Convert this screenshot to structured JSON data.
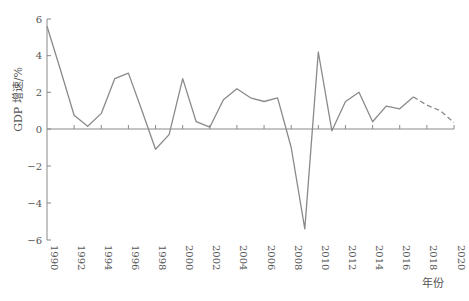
{
  "chart_data": {
    "type": "line",
    "title": "",
    "xlabel": "年份",
    "ylabel": "GDP 增速/%",
    "ylim": [
      -6,
      6
    ],
    "xlim": [
      1990,
      2020
    ],
    "grid": false,
    "legend": null,
    "yticks": [
      6,
      4,
      2,
      0,
      -2,
      -4,
      -6
    ],
    "ytick_labels": [
      "6",
      "4",
      "2",
      "0",
      "−2",
      "−4",
      "−6"
    ],
    "xticks": [
      1990,
      1992,
      1994,
      1996,
      1998,
      2000,
      2002,
      2004,
      2006,
      2008,
      2010,
      2012,
      2014,
      2016,
      2018,
      2020
    ],
    "series": [
      {
        "name": "actual",
        "style": "solid",
        "color": "#8a8a8a",
        "x": [
          1990,
          1991,
          1992,
          1993,
          1994,
          1995,
          1996,
          1997,
          1998,
          1999,
          2000,
          2001,
          2002,
          2003,
          2004,
          2005,
          2006,
          2007,
          2008,
          2009,
          2010,
          2011,
          2012,
          2013,
          2014,
          2015,
          2016,
          2017
        ],
        "values": [
          5.6,
          3.2,
          0.75,
          0.15,
          0.85,
          2.75,
          3.05,
          1.0,
          -1.1,
          -0.3,
          2.75,
          0.4,
          0.1,
          1.6,
          2.2,
          1.7,
          1.5,
          1.7,
          -1.0,
          -5.4,
          4.2,
          -0.1,
          1.5,
          2.0,
          0.4,
          1.25,
          1.1,
          1.75
        ]
      },
      {
        "name": "forecast",
        "style": "dashed",
        "color": "#8a8a8a",
        "x": [
          2017,
          2018,
          2019,
          2020
        ],
        "values": [
          1.75,
          1.3,
          1.0,
          0.35
        ]
      }
    ]
  }
}
